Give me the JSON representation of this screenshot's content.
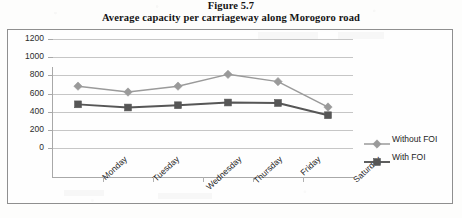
{
  "caption": {
    "figure_number": "Figure 5.7",
    "figure_title": "Average capacity per carriageway along Morogoro road"
  },
  "colors": {
    "without_foi": "#9a9a9a",
    "with_foi": "#565656",
    "gridline": "#c6c6c6",
    "axis": "#a8a8a8",
    "frame": "#8f8f8f",
    "text": "#1d1d1d",
    "plot_background": "#fefefe"
  },
  "chart_data": {
    "type": "line",
    "title": "Average capacity per carriageway along Morogoro road",
    "xlabel": "",
    "ylabel": "",
    "categories": [
      "Monday",
      "Tuesday",
      "Wednesday",
      "Thursday",
      "Friday",
      "Saturday"
    ],
    "series": [
      {
        "name": "Without FOI",
        "marker": "diamond",
        "color": "#9a9a9a",
        "values": [
          1000,
          935,
          1000,
          1130,
          1050,
          770
        ]
      },
      {
        "name": "With FOI",
        "marker": "square",
        "color": "#565656",
        "values": [
          800,
          765,
          790,
          820,
          815,
          680
        ]
      }
    ],
    "ylim": [
      0,
      1200
    ],
    "ytick_labels": [
      "0",
      "200",
      "400",
      "600",
      "800",
      "1000",
      "1200"
    ],
    "ytick_values": [
      0,
      200,
      400,
      600,
      800,
      1000,
      1200
    ],
    "grid": true,
    "grid_axis": "y",
    "legend_position": "right",
    "legend_entries": [
      "Without FOI",
      "With FOI"
    ]
  }
}
